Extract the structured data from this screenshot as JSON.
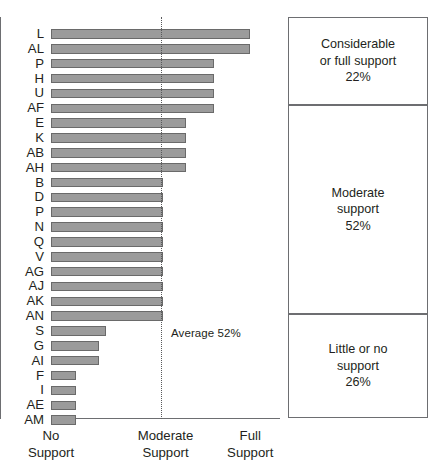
{
  "chart_data": {
    "type": "bar",
    "orientation": "horizontal",
    "title": "",
    "xlabel": "",
    "ylabel": "",
    "xlim": [
      0,
      100
    ],
    "grid": false,
    "categories": [
      "L",
      "AL",
      "P",
      "H",
      "U",
      "AF",
      "E",
      "K",
      "AB",
      "AH",
      "B",
      "D",
      "P",
      "N",
      "Q",
      "V",
      "AG",
      "AJ",
      "AK",
      "AN",
      "S",
      "G",
      "AI",
      "F",
      "I",
      "AE",
      "AM"
    ],
    "values": [
      87,
      87,
      71,
      71,
      71,
      71,
      59,
      59,
      59,
      59,
      49,
      49,
      49,
      49,
      49,
      49,
      49,
      49,
      49,
      49,
      24,
      21,
      21,
      11,
      11,
      11,
      11
    ],
    "axis_ticks": [
      {
        "value": 0,
        "line1": "No",
        "line2": "Support"
      },
      {
        "value": 50,
        "line1": "Moderate",
        "line2": "Support"
      },
      {
        "value": 87,
        "line1": "Full",
        "line2": "Support"
      }
    ],
    "annotations": [
      {
        "name": "average-line",
        "value": 50,
        "label": "Average 52%",
        "style": "dotted-vertical"
      }
    ],
    "legend_position": "right",
    "legend": [
      {
        "line1": "Considerable",
        "line2": "or full support",
        "percent": "22%"
      },
      {
        "line1": "Moderate",
        "line2": "support",
        "percent": "52%"
      },
      {
        "line1": "Little or no",
        "line2": "support",
        "percent": "26%"
      }
    ],
    "colors": {
      "bar_fill": "#9b9b9b",
      "bar_stroke": "#6a6a6a",
      "axis": "#6d6e71",
      "text": "#231f20",
      "legend_border": "#6d6e71",
      "average_line": "#58595b"
    }
  }
}
